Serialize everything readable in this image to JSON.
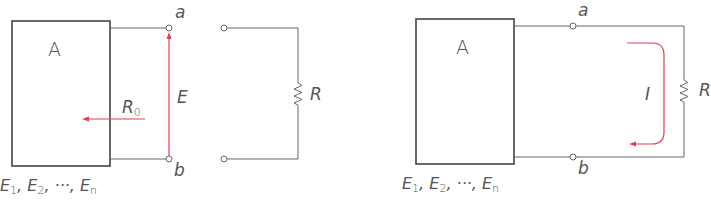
{
  "diagram": {
    "type": "circuit-schematic",
    "colors": {
      "wire": "#555555",
      "highlight": "#e04050",
      "text": "#555555"
    },
    "left_figure": {
      "network_label": "A",
      "sources_label": {
        "parts": [
          "E",
          "1",
          ", ",
          "E",
          "2",
          ", ···, ",
          "E",
          "n"
        ],
        "text": "E1, E2, ···, En"
      },
      "terminal_top": "a",
      "terminal_bottom": "b",
      "voltage_label": "E",
      "resistance_label": {
        "main": "R",
        "sub": "0"
      },
      "load_label": "R"
    },
    "right_figure": {
      "network_label": "A",
      "sources_label": {
        "text": "E1, E2, ···, En"
      },
      "terminal_top": "a",
      "terminal_bottom": "b",
      "current_label": "I",
      "load_label": "R"
    }
  }
}
